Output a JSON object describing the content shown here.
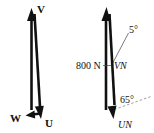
{
  "figure": {
    "title": "",
    "background_color": "#ffffff",
    "ink_color": "#111111",
    "guide_color": "#777777"
  },
  "diagrams": [
    {
      "id": "left-vector-triangle",
      "name": "left-diagram",
      "labels": {
        "apex": "V",
        "bottom_left": "W",
        "bottom_right": "U"
      },
      "vectors": [
        {
          "name": "V",
          "label": "V",
          "direction": "up",
          "style": "bold-arrow"
        },
        {
          "name": "U",
          "label": "U",
          "direction": "down",
          "style": "bold-arrow"
        },
        {
          "name": "W",
          "label": "W",
          "direction": "left",
          "style": "bold-arrow"
        }
      ]
    },
    {
      "id": "right-vector-triangle",
      "name": "right-diagram",
      "labels": {
        "magnitude": "800 N",
        "vertical_vector": "VN",
        "resultant_vector": "UN",
        "angle_top": "5°",
        "angle_bottom": "65°"
      },
      "vectors": [
        {
          "name": "VN",
          "label": "VN",
          "magnitude": "800 N",
          "direction": "up",
          "style": "bold-arrow"
        },
        {
          "name": "UN",
          "label": "UN",
          "direction": "down",
          "style": "bold-arrow"
        }
      ],
      "angles": [
        {
          "name": "angle-5",
          "value": "5°",
          "measured_from": "vertical"
        },
        {
          "name": "angle-65",
          "value": "65°",
          "measured_from": "horizontal-dashed-reference"
        }
      ],
      "guides": [
        {
          "name": "leader-line-5deg",
          "style": "thin-solid"
        },
        {
          "name": "reference-line-65deg",
          "style": "dashed"
        }
      ]
    }
  ]
}
